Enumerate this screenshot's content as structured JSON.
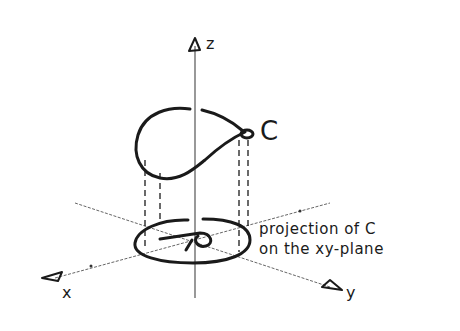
{
  "diagram": {
    "type": "3d-axes-projection-sketch",
    "style": "hand-drawn pen sketch",
    "colors": {
      "ink": "#1a1a1a",
      "axis": "#555555",
      "background": "#ffffff"
    },
    "axes": {
      "z": {
        "label": "z"
      },
      "x": {
        "label": "x"
      },
      "y": {
        "label": "y"
      }
    },
    "curve": {
      "label": "C"
    },
    "annotation": {
      "line1": "projection of C",
      "line2": "on the xy-plane"
    }
  }
}
